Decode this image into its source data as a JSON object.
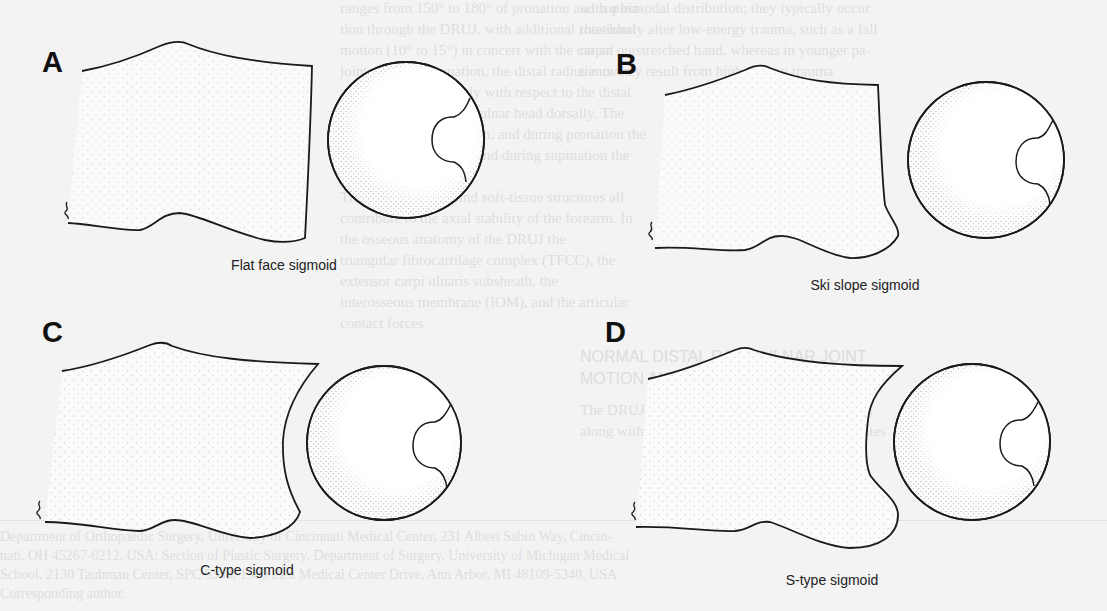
{
  "figure": {
    "panels": [
      {
        "id": "A",
        "label": "A",
        "caption": "Flat face sigmoid"
      },
      {
        "id": "B",
        "label": "B",
        "caption": "Ski slope sigmoid"
      },
      {
        "id": "C",
        "label": "C",
        "caption": "C-type sigmoid"
      },
      {
        "id": "D",
        "label": "D",
        "caption": "S-type sigmoid"
      }
    ],
    "colors": {
      "background": "#f3f3f3",
      "ink": "#1a1a1a",
      "stipple": "#555555",
      "bleed_text": "#dedede"
    }
  },
  "bleed_through": {
    "right_column": [
      "ranges from 150° to 180° of pronation and supina-",
      "tion through the DRUJ, with additional rotational",
      "motion (10° to 15°) in concert with the carpal",
      "joints. During pronation, the distal radius moves",
      "anteriorly and palmarly with respect to the distal",
      "ulna, and displaces the ulnar head dorsally. The",
      "TFCC resists this motion, and during pronation the",
      "dorsal TFCC tightens, and during supination the",
      "volar TFCC tightens.",
      "  The bony anatomy and soft-tissue structures all",
      "contribute to the axial stability of the forearm. In",
      "the osseous anatomy of the DRUJ the",
      "triangular fibrocartilage complex (TFCC), the",
      "extensor carpi ulnaris subsheath, the",
      "interosseous membrane (IOM), and the articular",
      "contact forces"
    ],
    "left_column": [
      "with a bimodal distribution; they typically occur",
      "the elderly after low-energy trauma, such as a fall",
      "on an outstretched hand, whereas in younger pa-",
      "tients they result from high-energy trauma"
    ],
    "heading": [
      "NORMAL DISTAL RADIOULNAR JOINT",
      "MOTION AND ANATOMY"
    ],
    "body_after_heading": [
      "The DRUJ is a complex diarthrodial joint which,",
      "along with the proximal radioulnar joint, facilitates"
    ],
    "footnote": [
      "Department of Orthopaedic Surgery, University of Cincinnati Medical Center, 231 Albert Sabin Way, Cincin-",
      "nati, OH 45267-0212, USA; Section of Plastic Surgery, Department of Surgery, University of Michigan Medical",
      "School, 2130 Taubman Center, SPC 5340, 1500 East Medical Center Drive, Ann Arbor, MI 48109-5340, USA",
      "Corresponding author."
    ]
  }
}
